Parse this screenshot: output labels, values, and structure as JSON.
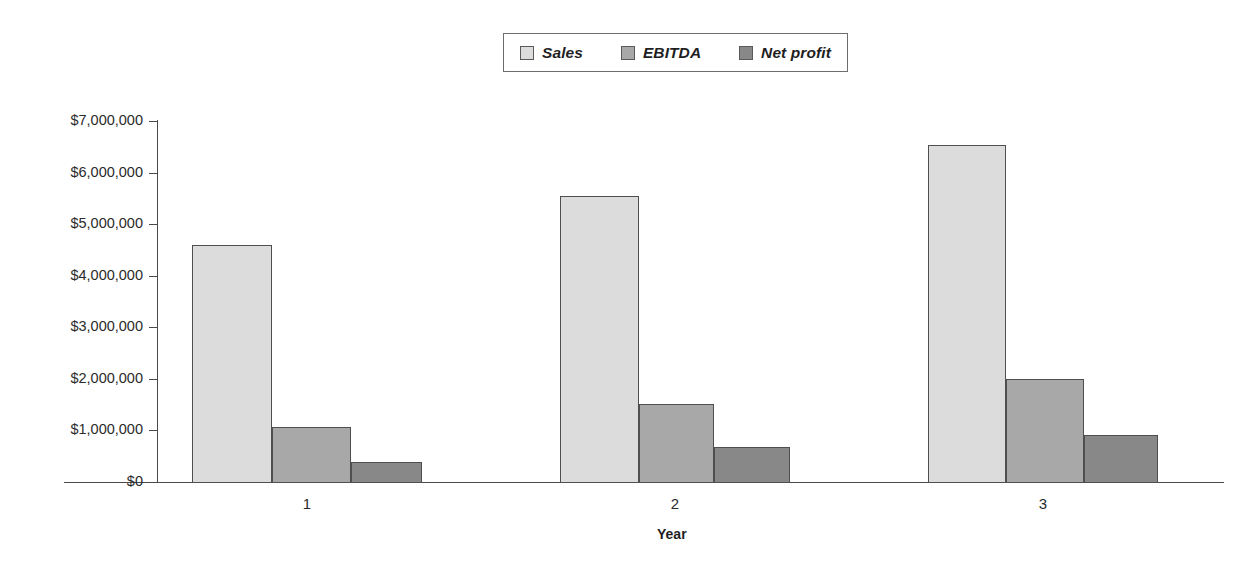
{
  "chart_data": {
    "type": "bar",
    "title": "",
    "subtitle": "",
    "xlabel": "Year",
    "ylabel": "",
    "categories": [
      "1",
      "2",
      "3"
    ],
    "series": [
      {
        "name": "Sales",
        "values": [
          4600000,
          5550000,
          6530000
        ],
        "color": "#dcdcdc"
      },
      {
        "name": "EBITDA",
        "values": [
          1070000,
          1510000,
          2000000
        ],
        "color": "#a8a8a8"
      },
      {
        "name": "Net profit",
        "values": [
          390000,
          680000,
          910000
        ],
        "color": "#888888"
      }
    ],
    "ylim": [
      0,
      7000000
    ],
    "ytick_values": [
      0,
      1000000,
      2000000,
      3000000,
      4000000,
      5000000,
      6000000,
      7000000
    ],
    "ytick_labels": [
      "$0",
      "$1,000,000",
      "$2,000,000",
      "$3,000,000",
      "$4,000,000",
      "$5,000,000",
      "$6,000,000",
      "$7,000,000"
    ],
    "grid": false,
    "legend_position": "top-center",
    "bar_border_color": "#4f4f4f",
    "axis_color": "#4a4a4a",
    "background": "#ffffff"
  },
  "legend": {
    "entries": [
      {
        "label": "Sales",
        "color": "#dcdcdc"
      },
      {
        "label": "EBITDA",
        "color": "#a8a8a8"
      },
      {
        "label": "Net profit",
        "color": "#888888"
      }
    ]
  },
  "axes": {
    "x_title": "Year",
    "x_labels": [
      "1",
      "2",
      "3"
    ],
    "y_labels": [
      "$7,000,000",
      "$6,000,000",
      "$5,000,000",
      "$4,000,000",
      "$3,000,000",
      "$2,000,000",
      "$1,000,000",
      "$0"
    ]
  }
}
